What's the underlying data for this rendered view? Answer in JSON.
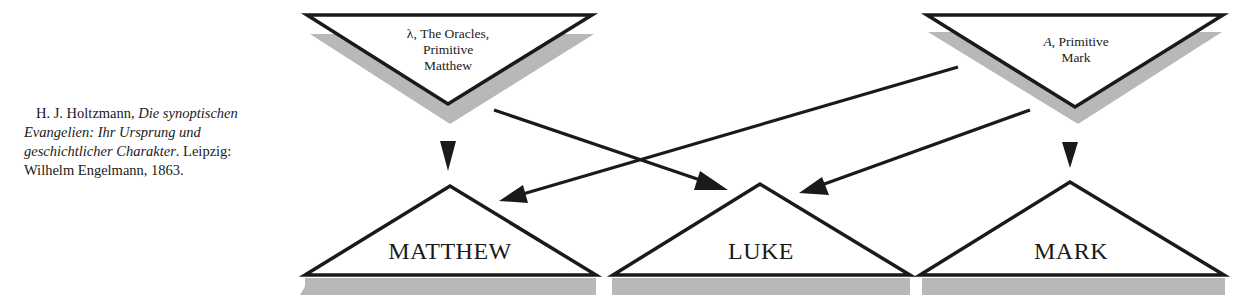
{
  "citation": {
    "author": "H. J. Holtzmann, ",
    "title_part1": "Die synoptischen",
    "title_part2": "Evangelien: Ihr Ursprung und",
    "title_part3": "geschichtlicher Charakter",
    "publisher_part1": ". Leipzig:",
    "publisher_part2": "Wilhelm Engelmann, 1863."
  },
  "sources": [
    {
      "id": "lambda",
      "symbol": "λ",
      "line1_rest": ", The Oracles,",
      "line2": "Primitive",
      "line3": "Matthew"
    },
    {
      "id": "A",
      "symbol": "A",
      "line1_rest": ", Primitive",
      "line2": "Mark"
    }
  ],
  "gospels": [
    {
      "id": "matthew",
      "label": "MATTHEW"
    },
    {
      "id": "luke",
      "label": "LUKE"
    },
    {
      "id": "mark",
      "label": "MARK"
    }
  ],
  "edges": [
    {
      "from": "lambda",
      "to": "matthew"
    },
    {
      "from": "lambda",
      "to": "luke"
    },
    {
      "from": "A",
      "to": "matthew"
    },
    {
      "from": "A",
      "to": "luke"
    },
    {
      "from": "A",
      "to": "mark"
    }
  ],
  "colors": {
    "stroke": "#1a1a1a",
    "shadow": "#b8b8b8",
    "fill": "#ffffff"
  }
}
